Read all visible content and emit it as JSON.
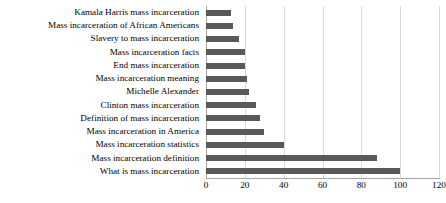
{
  "chart_data": {
    "type": "bar",
    "orientation": "horizontal",
    "title": "",
    "xlabel": "",
    "ylabel": "",
    "xlim": [
      0,
      120
    ],
    "xticks": [
      0,
      20,
      40,
      60,
      80,
      100,
      120
    ],
    "grid": true,
    "legend": false,
    "bar_color": "#595959",
    "grid_color": "#d9d9d9",
    "axis_color": "#a6a6a6",
    "categories": [
      "Kamala Harris mass incarceration",
      "Mass incarceration of African Americans",
      "Slavery to mass incarceration",
      "Mass incarceration facts",
      "End mass incarceration",
      "Mass incarceration meaning",
      "Michelle Alexander",
      "Clinton mass incarceration",
      "Definition of mass incarceration",
      "Mass incarceration in America",
      "Mass incarceration statistics",
      "Mass incarceration definition",
      "What is mass incarceration"
    ],
    "values": [
      13,
      14,
      17,
      20,
      20,
      21,
      22,
      26,
      28,
      30,
      40,
      88,
      100
    ]
  }
}
